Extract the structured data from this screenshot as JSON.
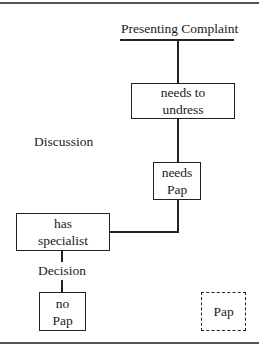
{
  "diagram": {
    "top_label": "Presenting Complaint",
    "side_label": "Discussion",
    "decision_label": "Decision",
    "nodes": [
      {
        "id": "needs-to-undress",
        "lines": [
          "needs to",
          "undress"
        ],
        "style": "solid"
      },
      {
        "id": "needs-pap",
        "lines": [
          "needs",
          "Pap"
        ],
        "style": "solid"
      },
      {
        "id": "has-specialist",
        "lines": [
          "has",
          "specialist"
        ],
        "style": "solid"
      },
      {
        "id": "no-pap",
        "lines": [
          "no",
          "Pap"
        ],
        "style": "solid"
      },
      {
        "id": "pap",
        "lines": [
          "Pap"
        ],
        "style": "dashed"
      }
    ],
    "edges": [
      [
        "Presenting Complaint",
        "needs-to-undress"
      ],
      [
        "needs-to-undress",
        "needs-pap"
      ],
      [
        "needs-pap",
        "has-specialist"
      ],
      [
        "has-specialist",
        "no-pap"
      ]
    ]
  }
}
